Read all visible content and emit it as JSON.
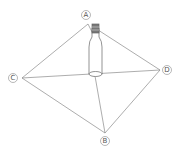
{
  "diagram": {
    "points": [
      {
        "label": "A",
        "x": 88,
        "y": 24,
        "lx": 86,
        "ly": 15
      },
      {
        "label": "B",
        "x": 105,
        "y": 133,
        "lx": 105,
        "ly": 141
      },
      {
        "label": "C",
        "x": 22,
        "y": 78,
        "lx": 13,
        "ly": 78
      },
      {
        "label": "D",
        "x": 160,
        "y": 70,
        "lx": 167,
        "ly": 70
      }
    ],
    "center": {
      "x": 95,
      "y": 74
    },
    "line_color": "#8a8a8a"
  }
}
